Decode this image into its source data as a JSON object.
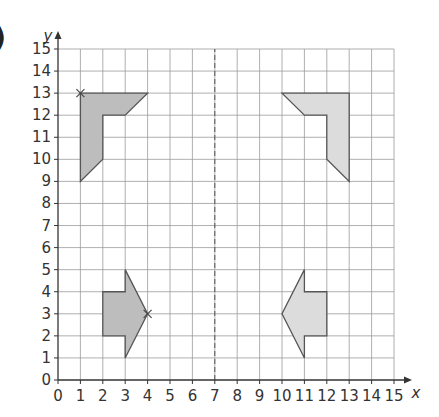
{
  "label": ")",
  "chart_data": {
    "type": "scatter",
    "title": "",
    "xlabel": "x",
    "ylabel": "y",
    "xlim": [
      0,
      15
    ],
    "ylim": [
      0,
      15
    ],
    "grid": true,
    "x_ticks": [
      0,
      1,
      2,
      3,
      4,
      5,
      6,
      7,
      8,
      9,
      10,
      11,
      12,
      13,
      14,
      15
    ],
    "y_ticks": [
      0,
      1,
      2,
      3,
      4,
      5,
      6,
      7,
      8,
      9,
      10,
      11,
      12,
      13,
      14,
      15
    ],
    "mirror_line": {
      "x": 7,
      "style": "dashed"
    },
    "shapes": [
      {
        "name": "L-shape left",
        "fill": "#bdbdbd",
        "points": [
          [
            1,
            13
          ],
          [
            4,
            13
          ],
          [
            3,
            12
          ],
          [
            2,
            12
          ],
          [
            2,
            10
          ],
          [
            1,
            9
          ]
        ],
        "marked_vertex": [
          1,
          13
        ]
      },
      {
        "name": "L-shape right",
        "fill": "#dcdcdc",
        "points": [
          [
            13,
            13
          ],
          [
            10,
            13
          ],
          [
            11,
            12
          ],
          [
            12,
            12
          ],
          [
            12,
            10
          ],
          [
            13,
            9
          ]
        ]
      },
      {
        "name": "Arrow left",
        "fill": "#bdbdbd",
        "points": [
          [
            2,
            4
          ],
          [
            3,
            4
          ],
          [
            3,
            5
          ],
          [
            4,
            3
          ],
          [
            3,
            1
          ],
          [
            3,
            2
          ],
          [
            2,
            2
          ]
        ],
        "marked_vertex": [
          4,
          3
        ]
      },
      {
        "name": "Arrow right",
        "fill": "#dcdcdc",
        "points": [
          [
            12,
            4
          ],
          [
            11,
            4
          ],
          [
            11,
            5
          ],
          [
            10,
            3
          ],
          [
            11,
            1
          ],
          [
            11,
            2
          ],
          [
            12,
            2
          ]
        ]
      }
    ]
  }
}
